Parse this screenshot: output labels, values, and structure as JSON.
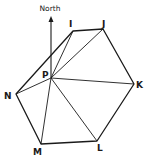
{
  "diagram": {
    "type": "geometry",
    "north_label": "North",
    "stroke_color": "#1a1a1a",
    "points": [
      {
        "name": "I",
        "x": 73,
        "y": 31,
        "lx": 70,
        "ly": 28
      },
      {
        "name": "J",
        "x": 103,
        "y": 29,
        "lx": 103,
        "ly": 27
      },
      {
        "name": "K",
        "x": 134,
        "y": 84,
        "lx": 136,
        "ly": 88
      },
      {
        "name": "L",
        "x": 97,
        "y": 141,
        "lx": 97,
        "ly": 150
      },
      {
        "name": "M",
        "x": 41,
        "y": 144,
        "lx": 34,
        "ly": 154
      },
      {
        "name": "N",
        "x": 16,
        "y": 94,
        "lx": 4,
        "ly": 99
      },
      {
        "name": "P",
        "x": 51,
        "y": 78,
        "lx": 42,
        "ly": 78
      }
    ],
    "labels": {
      "I": "I",
      "J": "J",
      "K": "K",
      "L": "L",
      "M": "M",
      "N": "N",
      "P": "P"
    },
    "polygon": [
      "I",
      "J",
      "K",
      "L",
      "M",
      "N"
    ],
    "spokes_from": "P",
    "spokes_to": [
      "I",
      "J",
      "K",
      "L",
      "M",
      "N"
    ]
  }
}
